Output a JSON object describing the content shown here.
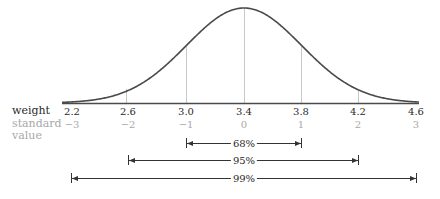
{
  "chart_data": {
    "type": "line",
    "title": "",
    "mean": 3.4,
    "sd": 0.4,
    "x": [
      2.2,
      2.6,
      3.0,
      3.4,
      3.8,
      4.2,
      4.6
    ],
    "xlabel": "weight",
    "x_tick_labels": [
      "2.2",
      "2.6",
      "3.0",
      "3.4",
      "3.8",
      "4.2",
      "4.6"
    ],
    "secondary_xlabel": "standard value",
    "standard_values": [
      "−3",
      "−2",
      "−1",
      "0",
      "1",
      "2",
      "3"
    ],
    "xlim": [
      2.2,
      4.6
    ],
    "grid_lines_at": [
      2.6,
      3.0,
      3.4,
      3.8,
      4.2
    ],
    "intervals": [
      {
        "label": "68%",
        "from": -1,
        "to": 1
      },
      {
        "label": "95%",
        "from": -2,
        "to": 2
      },
      {
        "label": "99%",
        "from": -3,
        "to": 3
      }
    ],
    "colors": {
      "curve": "#4a4a4a",
      "gridline": "#c8c8c8",
      "secondary_text": "#a8a8a8",
      "text": "#2a2a2a"
    }
  },
  "labels": {
    "weight": "weight",
    "standard": "standard",
    "value": "value",
    "ticks": [
      "2.2",
      "2.6",
      "3.0",
      "3.4",
      "3.8",
      "4.2",
      "4.6"
    ],
    "std": [
      "−3",
      "−2",
      "−1",
      "0",
      "1",
      "2",
      "3"
    ],
    "pct68": "68%",
    "pct95": "95%",
    "pct99": "99%"
  }
}
